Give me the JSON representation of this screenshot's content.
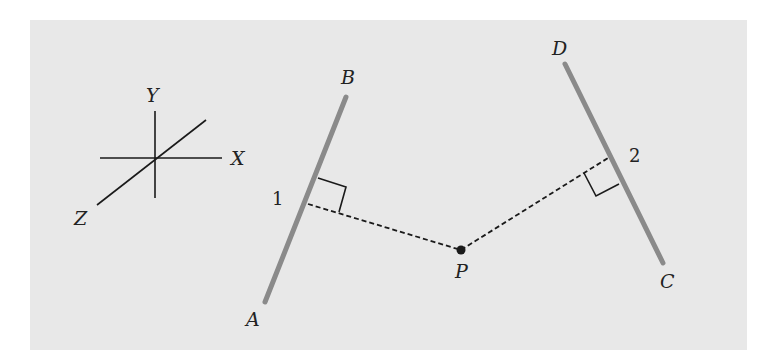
{
  "figure": {
    "axes_labels": {
      "x": "X",
      "y": "Y",
      "z": "Z"
    },
    "points": {
      "a": "A",
      "b": "B",
      "c": "C",
      "d": "D",
      "p": "P"
    },
    "foot_labels": {
      "one": "1",
      "two": "2"
    },
    "colors": {
      "rod": "#8a8a8a",
      "ink": "#1a1a1a",
      "background": "#e8e8e8"
    }
  }
}
